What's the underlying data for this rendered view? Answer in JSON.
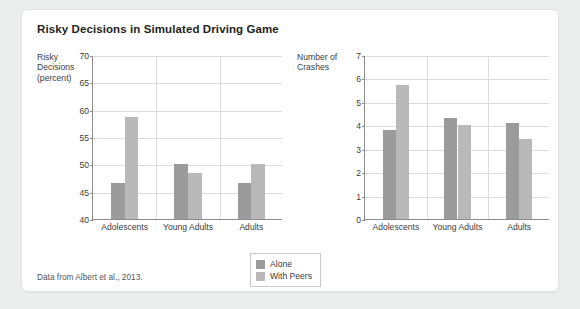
{
  "card": {
    "title": "Risky Decisions in Simulated Driving Game",
    "source": "Data from Albert et al., 2013."
  },
  "legend": {
    "items": [
      {
        "label": "Alone",
        "color": "#9b9b9b",
        "swatch_name": "legend-swatch-alone"
      },
      {
        "label": "With Peers",
        "color": "#b9b9b9",
        "swatch_name": "legend-swatch-with-peers"
      }
    ]
  },
  "chart_data": [
    {
      "type": "bar",
      "id": "risky-decisions",
      "title": "Risky Decisions in Simulated Driving Game",
      "ylabel": "Risky\nDecisions\n(percent)",
      "xlabel": "",
      "categories": [
        "Adolescents",
        "Young Adults",
        "Adults"
      ],
      "series": [
        {
          "name": "Alone",
          "color": "#9b9b9b",
          "values": [
            46.5,
            50.1,
            46.5
          ]
        },
        {
          "name": "With Peers",
          "color": "#b9b9b9",
          "values": [
            58.7,
            48.4,
            50.0
          ]
        }
      ],
      "ylim": [
        40,
        70
      ],
      "yticks": [
        40,
        45,
        50,
        55,
        60,
        65,
        70
      ],
      "grid": true,
      "legend_position": "bottom-center"
    },
    {
      "type": "bar",
      "id": "number-of-crashes",
      "title": "",
      "ylabel": "Number of\nCrashes",
      "xlabel": "",
      "categories": [
        "Adolescents",
        "Young Adults",
        "Adults"
      ],
      "series": [
        {
          "name": "Alone",
          "color": "#9b9b9b",
          "values": [
            3.8,
            4.3,
            4.1
          ]
        },
        {
          "name": "With Peers",
          "color": "#b9b9b9",
          "values": [
            5.7,
            4.0,
            3.4
          ]
        }
      ],
      "ylim": [
        0,
        7
      ],
      "yticks": [
        0,
        1,
        2,
        3,
        4,
        5,
        6,
        7
      ],
      "grid": true,
      "legend_position": "bottom-center"
    }
  ]
}
